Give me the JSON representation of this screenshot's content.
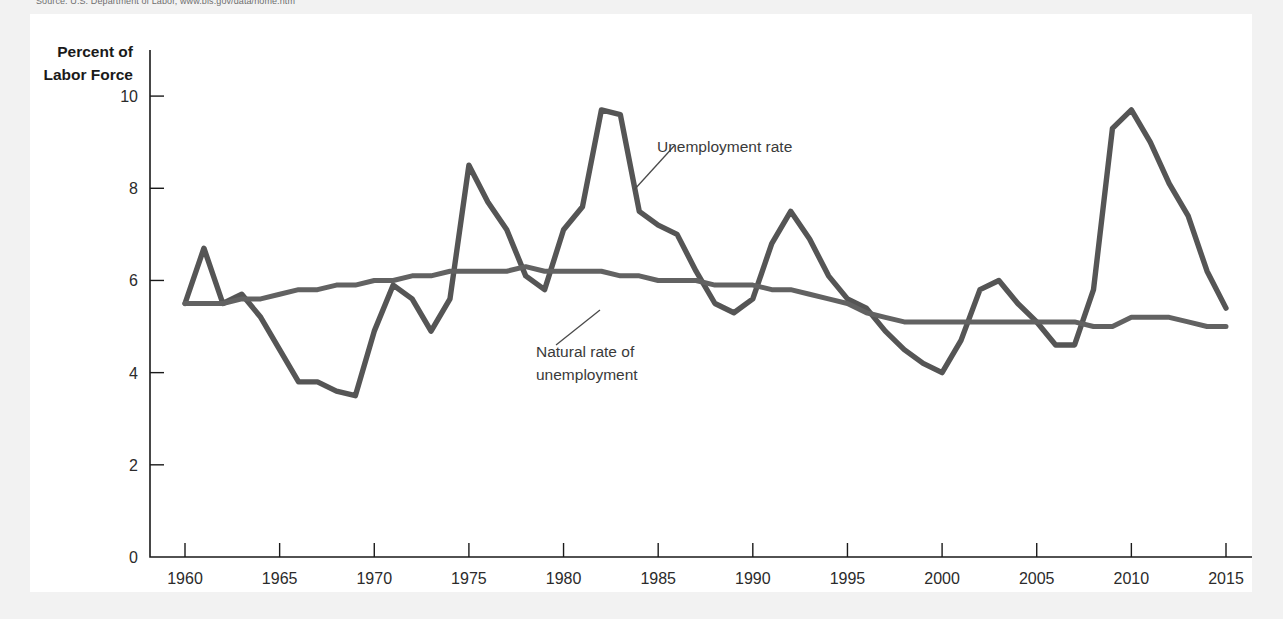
{
  "figure": {
    "source_note": "Source: U.S. Department of Labor, www.bls.gov/data/home.htm",
    "panel_background": "#ffffff",
    "outer_background": "#f2f2f2"
  },
  "chart_data": {
    "type": "line",
    "title": "",
    "subtitle": "",
    "xlabel": "",
    "ylabel": "Percent of Labor Force",
    "ylabel_line1": "Percent of",
    "ylabel_line2": "Labor Force",
    "xlim": [
      1960,
      2015
    ],
    "ylim": [
      0,
      11
    ],
    "grid": false,
    "legend_position": "inline-annotations",
    "ytick_values": [
      0,
      2,
      4,
      6,
      8,
      10
    ],
    "ytick_labels": [
      "0",
      "2",
      "4",
      "6",
      "8",
      "10"
    ],
    "xtick_values": [
      1960,
      1965,
      1970,
      1975,
      1980,
      1985,
      1990,
      1995,
      2000,
      2005,
      2010,
      2015
    ],
    "xtick_labels": [
      "1960",
      "1965",
      "1970",
      "1975",
      "1980",
      "1985",
      "1990",
      "1995",
      "2000",
      "2005",
      "2010",
      "2015"
    ],
    "x": [
      1960,
      1961,
      1962,
      1963,
      1964,
      1965,
      1966,
      1967,
      1968,
      1969,
      1970,
      1971,
      1972,
      1973,
      1974,
      1975,
      1976,
      1977,
      1978,
      1979,
      1980,
      1981,
      1982,
      1983,
      1984,
      1985,
      1986,
      1987,
      1988,
      1989,
      1990,
      1991,
      1992,
      1993,
      1994,
      1995,
      1996,
      1997,
      1998,
      1999,
      2000,
      2001,
      2002,
      2003,
      2004,
      2005,
      2006,
      2007,
      2008,
      2009,
      2010,
      2011,
      2012,
      2013,
      2014,
      2015
    ],
    "series": [
      {
        "name": "Unemployment rate",
        "color": "#555555",
        "stroke_width": 5.4,
        "values": [
          5.5,
          6.7,
          5.5,
          5.7,
          5.2,
          4.5,
          3.8,
          3.8,
          3.6,
          3.5,
          4.9,
          5.9,
          5.6,
          4.9,
          5.6,
          8.5,
          7.7,
          7.1,
          6.1,
          5.8,
          7.1,
          7.6,
          9.7,
          9.6,
          7.5,
          7.2,
          7.0,
          6.2,
          5.5,
          5.3,
          5.6,
          6.8,
          7.5,
          6.9,
          6.1,
          5.6,
          5.4,
          4.9,
          4.5,
          4.2,
          4.0,
          4.7,
          5.8,
          6.0,
          5.5,
          5.1,
          4.6,
          4.6,
          5.8,
          9.3,
          9.7,
          9.0,
          8.1,
          7.4,
          6.2,
          5.4
        ]
      },
      {
        "name": "Natural rate of unemployment",
        "color": "#626262",
        "stroke_width": 5.0,
        "values": [
          5.5,
          5.5,
          5.5,
          5.6,
          5.6,
          5.7,
          5.8,
          5.8,
          5.9,
          5.9,
          6.0,
          6.0,
          6.1,
          6.1,
          6.2,
          6.2,
          6.2,
          6.2,
          6.3,
          6.2,
          6.2,
          6.2,
          6.2,
          6.1,
          6.1,
          6.0,
          6.0,
          6.0,
          5.9,
          5.9,
          5.9,
          5.8,
          5.8,
          5.7,
          5.6,
          5.5,
          5.3,
          5.2,
          5.1,
          5.1,
          5.1,
          5.1,
          5.1,
          5.1,
          5.1,
          5.1,
          5.1,
          5.1,
          5.0,
          5.0,
          5.2,
          5.2,
          5.2,
          5.1,
          5.0,
          5.0
        ]
      }
    ],
    "annotations": [
      {
        "name": "unemployment-rate",
        "text": "Unemployment rate",
        "lines": [
          "Unemployment rate"
        ],
        "label_x": 657,
        "label_y": 152,
        "leader": [
          634,
          190,
          675,
          145
        ]
      },
      {
        "name": "natural-rate",
        "text": "Natural rate of unemployment",
        "lines": [
          "Natural rate of",
          "unemployment"
        ],
        "label_x": 536,
        "label_y": 357,
        "leader": [
          600,
          310,
          556,
          345
        ]
      }
    ]
  }
}
